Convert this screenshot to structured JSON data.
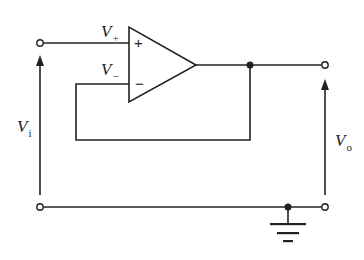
{
  "diagram": {
    "labels": {
      "v_plus": {
        "main": "V",
        "sub": "+"
      },
      "v_minus": {
        "main": "V",
        "sub": "−"
      },
      "v_in": {
        "main": "V",
        "sub": "i"
      },
      "v_out": {
        "main": "V",
        "sub": "o"
      }
    },
    "opamp": {
      "plus_sign": "+",
      "minus_sign": "−"
    },
    "colors": {
      "wire": "#222222",
      "background": "#ffffff"
    }
  }
}
